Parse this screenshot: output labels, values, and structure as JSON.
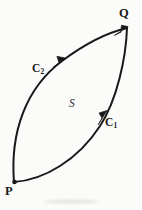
{
  "figure": {
    "type": "vector-diagram",
    "background_color": "#fbfbfa",
    "ink_color": "#19181a",
    "vertices": [
      {
        "id": "P",
        "label": "P",
        "x": 14,
        "y": 182,
        "label_x": 5,
        "label_y": 185
      },
      {
        "id": "Q",
        "label": "Q",
        "x": 127,
        "y": 28,
        "label_x": 119,
        "label_y": 7
      }
    ],
    "curves": [
      {
        "id": "C1",
        "label": "C",
        "subscript": "1",
        "from": "P",
        "to": "Q",
        "bulge": "right",
        "label_x": 105,
        "label_y": 117,
        "arrow_x": 103,
        "arrow_y": 112,
        "arrow_direction": "up-right"
      },
      {
        "id": "C2",
        "label": "C",
        "subscript": "2",
        "from": "P",
        "to": "Q",
        "bulge": "left",
        "label_x": 32,
        "label_y": 63,
        "arrow_x": 60,
        "arrow_y": 76,
        "arrow_direction": "up-right"
      }
    ],
    "region": {
      "id": "S",
      "label": "S",
      "style": "italic",
      "x": 69,
      "y": 98
    }
  }
}
